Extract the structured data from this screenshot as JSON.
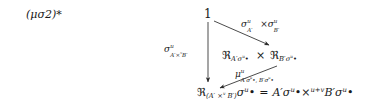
{
  "figure": {
    "kind": "commutative-diagram",
    "background_color": "#ffffff",
    "ink_color": "#1a1a1a",
    "equation_tag": "(μσ2)*"
  },
  "nodes": {
    "apex": {
      "id": "apex",
      "text": "1"
    },
    "middle": {
      "id": "product-of-restrictions",
      "text": "ℜA′σu• × ℜB′σu•",
      "parts": {
        "left_symbol": "ℜ",
        "left_subscript": "A′σ",
        "left_sub_sup": "u",
        "left_sub_bullet": "•",
        "times": "×",
        "right_symbol": "ℜ",
        "right_subscript": "B′σ",
        "right_sub_sup": "u",
        "right_sub_bullet": "•"
      }
    },
    "bottom": {
      "id": "restriction-of-product-equals",
      "text": "ℜ(A′ ×v B′)σu• = A′σu• ×u+v B′σu•",
      "parts": {
        "symbol": "ℜ",
        "subscript_open": "(A′ ",
        "subscript_times": "×",
        "subscript_times_sup": "v",
        "subscript_close": " B′)",
        "sigma": "σ",
        "sigma_sup": "u",
        "bullet": "•",
        "equals": "=",
        "rhs_left": "A′σ",
        "rhs_left_sup": "u",
        "rhs_left_bullet": "•",
        "rhs_times": "×",
        "rhs_times_sup": "u+v",
        "rhs_right": "B′σ",
        "rhs_right_sup": "u",
        "rhs_right_bullet": "•"
      }
    }
  },
  "arrows": [
    {
      "id": "apex-to-middle",
      "from": "apex",
      "to": "middle",
      "direction": "down-right",
      "label": "σuA′ × σuB′",
      "label_parts": {
        "sigma": "σ",
        "sup": "u",
        "sub": "A′",
        "times": "×",
        "sigma2": "σ",
        "sup2": "u",
        "sub2": "B′"
      }
    },
    {
      "id": "apex-to-bottom",
      "from": "apex",
      "to": "bottom",
      "direction": "down",
      "label": "σuA′ ×v B′",
      "label_parts": {
        "sigma": "σ",
        "sup": "u",
        "sub_left": "A′",
        "sub_times": "×",
        "sub_times_sup": "v",
        "sub_right": "B′"
      }
    },
    {
      "id": "middle-to-bottom",
      "from": "middle",
      "to": "bottom",
      "direction": "down-left",
      "label": "μuA′σu•, B′σu•",
      "label_parts": {
        "mu": "μ",
        "sup": "u",
        "sub_left": "A′σ",
        "sub_left_sup": "u",
        "sub_left_bullet": "•",
        "sub_comma": ", ",
        "sub_right": "B′σ",
        "sub_right_sup": "u",
        "sub_right_bullet": "•"
      }
    }
  ],
  "symbols": {
    "times": "×",
    "bullet": "•",
    "equals": "=",
    "fraktur_r": "ℜ",
    "sigma": "σ",
    "mu": "μ",
    "prime": "′"
  }
}
